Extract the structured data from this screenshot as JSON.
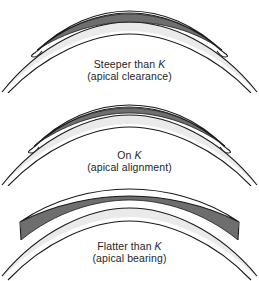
{
  "figure": {
    "background_color": "#ffffff"
  },
  "colors": {
    "lens_fill": "#ffffff",
    "tear_gap_fill": "#6e6e6e",
    "cornea_fill": "#e6e6e6",
    "outline": "#1a1a1a",
    "text": "#262626"
  },
  "panels": [
    {
      "id": "steeper",
      "label_line1_prefix": "Steeper than ",
      "label_line1_symbol": "K",
      "label_line2": "(apical clearance)",
      "tear_gap": "thick at apex, touching at periphery"
    },
    {
      "id": "on-k",
      "label_line1_prefix": "On ",
      "label_line1_symbol": "K",
      "label_line2": "(apical alignment)",
      "tear_gap": "uniform thin layer"
    },
    {
      "id": "flatter",
      "label_line1_prefix": "Flatter than ",
      "label_line1_symbol": "K",
      "label_line2": "(apical bearing)",
      "tear_gap": "touching at apex, thick at periphery"
    }
  ]
}
